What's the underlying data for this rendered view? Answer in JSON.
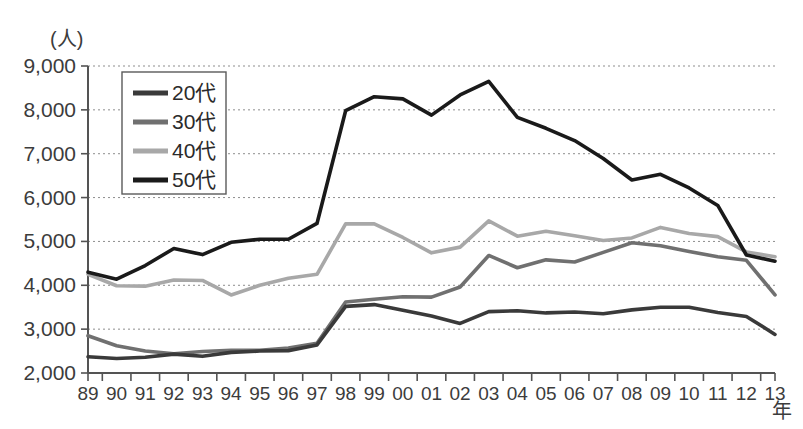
{
  "chart_data": {
    "type": "line",
    "title": "",
    "xlabel": "年",
    "ylabel": "(人)",
    "ylim": [
      2000,
      9000
    ],
    "y_ticks": [
      "2,000",
      "3,000",
      "4,000",
      "5,000",
      "6,000",
      "7,000",
      "8,000",
      "9,000"
    ],
    "y_tick_values": [
      2000,
      3000,
      4000,
      5000,
      6000,
      7000,
      8000,
      9000
    ],
    "grid": true,
    "legend_position": "upper-left-inside",
    "categories": [
      "89",
      "90",
      "91",
      "92",
      "93",
      "94",
      "95",
      "96",
      "97",
      "98",
      "99",
      "00",
      "01",
      "02",
      "03",
      "04",
      "05",
      "06",
      "07",
      "08",
      "09",
      "10",
      "11",
      "12",
      "13"
    ],
    "series": [
      {
        "name": "20代",
        "color": "#3a3a3a",
        "values": [
          2370,
          2330,
          2360,
          2430,
          2380,
          2470,
          2500,
          2510,
          2640,
          3520,
          3560,
          3430,
          3300,
          3130,
          3400,
          3420,
          3370,
          3390,
          3350,
          3440,
          3500,
          3500,
          3380,
          3290,
          2880
        ]
      },
      {
        "name": "30代",
        "color": "#707070",
        "values": [
          2850,
          2620,
          2500,
          2440,
          2490,
          2520,
          2520,
          2570,
          2680,
          3620,
          3680,
          3740,
          3730,
          3960,
          4680,
          4400,
          4580,
          4530,
          4750,
          4970,
          4900,
          4770,
          4650,
          4570,
          3780
        ]
      },
      {
        "name": "40代",
        "color": "#a8a8a8",
        "values": [
          4250,
          3990,
          3980,
          4120,
          4110,
          3780,
          4000,
          4160,
          4250,
          5400,
          5400,
          5090,
          4740,
          4870,
          5470,
          5120,
          5230,
          5130,
          5020,
          5080,
          5320,
          5180,
          5110,
          4760,
          4650
        ]
      },
      {
        "name": "50代",
        "color": "#1a1a1a",
        "values": [
          4300,
          4140,
          4450,
          4840,
          4700,
          4980,
          5050,
          5050,
          5410,
          7980,
          8300,
          8250,
          7880,
          8340,
          8650,
          7830,
          7580,
          7300,
          6890,
          6400,
          6530,
          6220,
          5820,
          4690,
          4550
        ]
      }
    ]
  },
  "axis": {
    "y_unit_label": "(人)",
    "x_unit_label": "年"
  }
}
